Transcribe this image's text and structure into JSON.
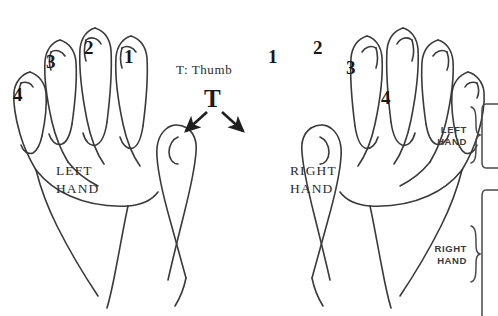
{
  "figure": {
    "title_text": "",
    "type": "hand-finger-numbering-diagram",
    "background_color": "#ffffff",
    "ink_color": "#2b2b2b"
  },
  "legend": {
    "thumb_key": "T: Thumb",
    "thumb_marker": "T"
  },
  "left_hand": {
    "label_line1": "LEFT",
    "label_line2": "HAND",
    "finger_numbers": [
      "4",
      "3",
      "2",
      "1"
    ]
  },
  "right_hand": {
    "label_line1": "RIGHT",
    "label_line2": "HAND",
    "finger_numbers": [
      "1",
      "2",
      "3",
      "4"
    ]
  },
  "side_panel": {
    "left_hand_line1": "LEFT",
    "left_hand_line2": "HAND",
    "right_hand_line1": "RIGHT",
    "right_hand_line2": "HAND",
    "brace_glyph": "{"
  },
  "arrows": {
    "count": 2,
    "from": "T",
    "to_left_thumb": "left thumb tip",
    "to_right_thumb": "right thumb tip"
  }
}
